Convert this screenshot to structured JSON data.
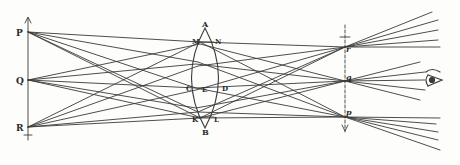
{
  "diagram": {
    "type": "optics-ray-diagram",
    "colors": {
      "ink": "#3a3a3a",
      "background": "#fdfdfb"
    },
    "object": {
      "labels": {
        "top": "P",
        "middle": "Q",
        "bottom": "R"
      }
    },
    "lens": {
      "labels": {
        "top": "A",
        "bottom": "B",
        "upper_left": "M",
        "upper_right": "N",
        "lower_left": "K",
        "lower_right": "L",
        "left": "C",
        "center": "E",
        "right": "D"
      }
    },
    "image": {
      "labels": {
        "top": "r",
        "middle": "q",
        "bottom": "p"
      }
    },
    "eye": {
      "icon": "eye-icon"
    }
  }
}
